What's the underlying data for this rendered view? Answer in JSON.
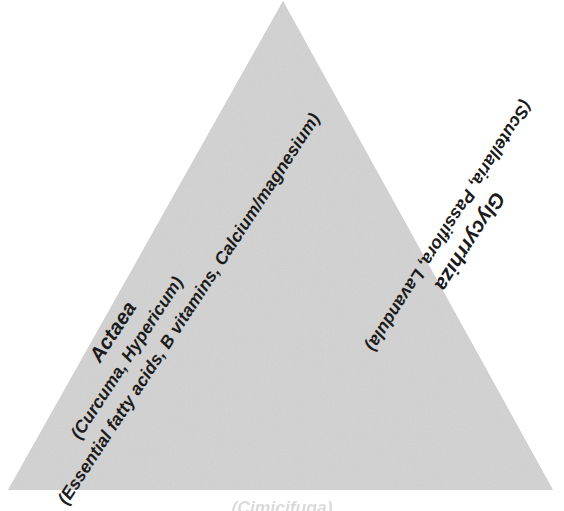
{
  "diagram": {
    "type": "triangle",
    "background_color": "#ffffff",
    "fill_color": "#d4d4d4",
    "text_color": "#1b1b1b",
    "shape": {
      "apex": "283,1",
      "bottom_left": "8,490",
      "bottom_right": "553,490"
    },
    "left_edge": {
      "primary": "Actaea",
      "secondary": "(Curcuma, Hypericum)",
      "tertiary": "(Essential fatty acids, B vitamins, Calcium/magnesium)"
    },
    "right_edge": {
      "primary": "Glycyrrhiza",
      "secondary": "(Scutellaria, Passiflora, Lavandula)"
    },
    "bottom_edge": {
      "caption": "(Cimicifuga)"
    }
  }
}
